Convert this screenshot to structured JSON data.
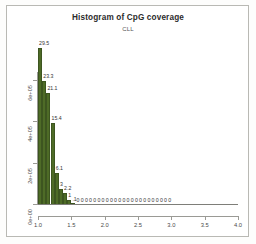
{
  "figure": {
    "title": "Histogram of CpG coverage",
    "subtitle": "CLL",
    "background": "#ffffff",
    "bar_color": "#4e6b27",
    "axis_color": "#9a9a95"
  },
  "chart_data": {
    "type": "bar",
    "title": "Histogram of CpG coverage",
    "subtitle": "CLL",
    "xlabel": "",
    "ylabel": "Frequency",
    "xlim": [
      1.0,
      4.0
    ],
    "ylim": [
      0,
      800000
    ],
    "grid": false,
    "legend": null,
    "x_ticks": [
      "1.0",
      "1.5",
      "2.0",
      "2.5",
      "3.0",
      "3.5",
      "4.0"
    ],
    "x_tick_values": [
      1.0,
      1.5,
      2.0,
      2.5,
      3.0,
      3.5,
      4.0
    ],
    "y_ticks": [
      "0e+00",
      "2e+05",
      "4e+05",
      "6e+05"
    ],
    "y_tick_values": [
      0,
      200000,
      400000,
      600000
    ],
    "bin_width": 0.0625,
    "bin_starts": [
      1.0,
      1.0625,
      1.125,
      1.1875,
      1.25,
      1.3125,
      1.375,
      1.4375,
      1.5,
      1.5625,
      1.625,
      1.6875,
      1.75,
      1.8125,
      1.875,
      1.9375,
      2.0,
      2.0625,
      2.125,
      2.1875,
      2.25,
      2.3125,
      2.375,
      2.4375,
      2.5,
      2.5625,
      2.625,
      2.6875,
      2.75,
      2.8125,
      2.875,
      2.9375,
      3.0,
      3.0625,
      3.125,
      3.1875,
      3.25,
      3.3125,
      3.375,
      3.4375,
      3.5,
      3.5625,
      3.625,
      3.6875,
      3.75,
      3.8125,
      3.875,
      3.9375
    ],
    "labels": [
      "29.5",
      "23.3",
      "21.1",
      "15.4",
      "6.1",
      "3",
      "2.2",
      "1",
      ".1",
      "0",
      "0",
      "0",
      "0",
      "0",
      "0",
      "0",
      "0",
      "0",
      "0",
      "0",
      "0",
      "0",
      "0",
      "0",
      "0",
      "0",
      "0",
      "0",
      "0",
      "0",
      "0",
      "0"
    ],
    "values": [
      29.5,
      23.3,
      21.1,
      15.4,
      6.1,
      3,
      2.2,
      1,
      0.1,
      0,
      0,
      0,
      0,
      0,
      0,
      0,
      0,
      0,
      0,
      0,
      0,
      0,
      0,
      0,
      0,
      0,
      0,
      0,
      0,
      0,
      0,
      0
    ],
    "value_unit": "percent",
    "bar_heights_frequency": [
      755000,
      596000,
      540000,
      394000,
      156000,
      77000,
      56000,
      26000,
      3000,
      0,
      0,
      0,
      0,
      0,
      0,
      0,
      0,
      0,
      0,
      0,
      0,
      0,
      0,
      0,
      0,
      0,
      0,
      0,
      0,
      0,
      0,
      0
    ]
  }
}
